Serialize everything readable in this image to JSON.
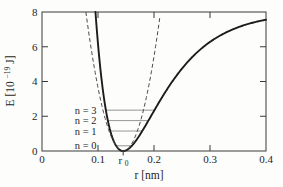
{
  "figure": {
    "background": "#fdfdfc",
    "frame_color": "#3a3a3a"
  },
  "chart_data": {
    "type": "line",
    "title": "",
    "xlabel": "r [nm]",
    "ylabel": "E [10⁻¹⁹ J]",
    "ylabel_parts": {
      "prefix": "E [10",
      "exponent": "−19",
      "suffix": " J]"
    },
    "xlim": [
      0,
      0.4
    ],
    "ylim": [
      0,
      8
    ],
    "grid": false,
    "legend": false,
    "x_ticks": [
      {
        "value": 0,
        "label": "0"
      },
      {
        "value": 0.1,
        "label": "0.1"
      },
      {
        "value": 0.2,
        "label": "0.2"
      },
      {
        "value": 0.3,
        "label": "0.3"
      },
      {
        "value": 0.4,
        "label": "0.4"
      }
    ],
    "y_ticks": [
      {
        "value": 0,
        "label": "0"
      },
      {
        "value": 2,
        "label": "2"
      },
      {
        "value": 4,
        "label": "4"
      },
      {
        "value": 6,
        "label": "6"
      },
      {
        "value": 8,
        "label": "8"
      }
    ],
    "r0_annotation": {
      "label": "r",
      "sub": "0",
      "value": 0.145
    },
    "series": [
      {
        "name": "anharmonic potential (Morse, solid)",
        "style": "solid",
        "model": "morse",
        "params": {
          "D": 8.0,
          "a": 14.0,
          "r0": 0.145
        },
        "color": "#1c1c1c",
        "width": 1.9,
        "notes": "E(r)=D(1-exp(-a(r-r0)))^2 ; reaches E≈7.6 at r=0.4, crosses E=8 at r≈0.095"
      },
      {
        "name": "harmonic approximation (dashed)",
        "style": "dashed",
        "model": "harmonic",
        "params": {
          "k_over_2": 1800,
          "r0": 0.145
        },
        "color": "#4a4a4a",
        "width": 1,
        "notes": "E(r)=k/2 (r-r0)^2 ; crosses E=8 at r≈0.08 and r≈0.21"
      }
    ],
    "energy_levels": [
      {
        "n": 0,
        "label": "n = 0",
        "E": 0.3
      },
      {
        "n": 1,
        "label": "n = 1",
        "E": 1.15
      },
      {
        "n": 2,
        "label": "n = 2",
        "E": 1.75
      },
      {
        "n": 3,
        "label": "n = 3",
        "E": 2.35
      }
    ],
    "level_line_color": "#8a8a8a"
  }
}
